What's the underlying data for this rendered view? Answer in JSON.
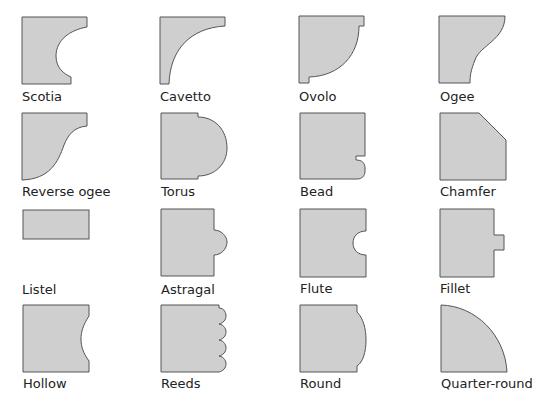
{
  "colors": {
    "fill": "#cfcfcf",
    "stroke": "#555555",
    "text": "#222222",
    "background": "#ffffff"
  },
  "profiles": [
    {
      "name": "Scotia"
    },
    {
      "name": "Cavetto"
    },
    {
      "name": "Ovolo"
    },
    {
      "name": "Ogee"
    },
    {
      "name": "Reverse ogee"
    },
    {
      "name": "Torus"
    },
    {
      "name": "Bead"
    },
    {
      "name": "Chamfer"
    },
    {
      "name": "Listel"
    },
    {
      "name": "Astragal"
    },
    {
      "name": "Flute"
    },
    {
      "name": "Fillet"
    },
    {
      "name": "Hollow"
    },
    {
      "name": "Reeds"
    },
    {
      "name": "Round"
    },
    {
      "name": "Quarter-round"
    }
  ]
}
